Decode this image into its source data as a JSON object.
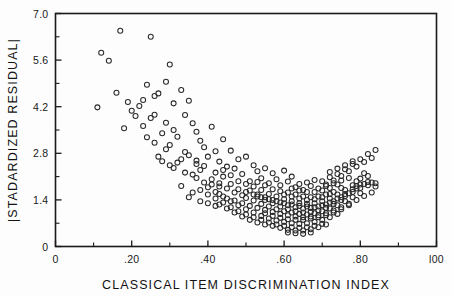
{
  "chart_data": {
    "type": "scatter",
    "title": "",
    "xlabel": "CLASSICAL ITEM DISCRIMINATION INDEX",
    "ylabel": "|STADARDIZED RESIDUAL|",
    "xlim": [
      0,
      1.0
    ],
    "ylim": [
      0,
      7.0
    ],
    "grid": false,
    "legend": null,
    "xticks": [
      0,
      0.2,
      0.4,
      0.6,
      0.8,
      1.0
    ],
    "xticklabels": [
      "0",
      ".20",
      ".40",
      ".60",
      ".80",
      "l00"
    ],
    "yticks": [
      0,
      1.4,
      2.8,
      4.2,
      5.6,
      7.0
    ],
    "yticklabels": [
      "0",
      "1.4",
      "2.8",
      "4.2",
      "5.6",
      "7.0"
    ],
    "x_minor_interval": 0.1,
    "y_minor_interval": 0.7,
    "marker": "open-circle",
    "marker_radius_px": 2.5,
    "marker_color": "#2a2a2a",
    "n_points": 301,
    "points": [
      [
        0.17,
        6.48
      ],
      [
        0.25,
        6.3
      ],
      [
        0.12,
        5.82
      ],
      [
        0.3,
        5.47
      ],
      [
        0.29,
        4.95
      ],
      [
        0.16,
        4.62
      ],
      [
        0.24,
        4.86
      ],
      [
        0.26,
        4.52
      ],
      [
        0.27,
        4.6
      ],
      [
        0.22,
        4.22
      ],
      [
        0.2,
        4.08
      ],
      [
        0.33,
        4.7
      ],
      [
        0.21,
        3.92
      ],
      [
        0.31,
        4.3
      ],
      [
        0.35,
        4.38
      ],
      [
        0.18,
        3.55
      ],
      [
        0.23,
        3.62
      ],
      [
        0.28,
        3.4
      ],
      [
        0.34,
        3.95
      ],
      [
        0.36,
        3.7
      ],
      [
        0.32,
        3.3
      ],
      [
        0.37,
        3.45
      ],
      [
        0.38,
        3.18
      ],
      [
        0.3,
        3.05
      ],
      [
        0.26,
        3.12
      ],
      [
        0.29,
        2.92
      ],
      [
        0.41,
        3.6
      ],
      [
        0.39,
        2.98
      ],
      [
        0.42,
        2.86
      ],
      [
        0.35,
        2.74
      ],
      [
        0.33,
        2.62
      ],
      [
        0.44,
        3.22
      ],
      [
        0.4,
        2.7
      ],
      [
        0.43,
        2.55
      ],
      [
        0.37,
        2.48
      ],
      [
        0.46,
        2.88
      ],
      [
        0.45,
        2.4
      ],
      [
        0.48,
        2.62
      ],
      [
        0.38,
        2.3
      ],
      [
        0.34,
        2.22
      ],
      [
        0.47,
        2.34
      ],
      [
        0.5,
        2.7
      ],
      [
        0.49,
        2.18
      ],
      [
        0.52,
        2.44
      ],
      [
        0.44,
        2.1
      ],
      [
        0.41,
        2.02
      ],
      [
        0.53,
        2.26
      ],
      [
        0.51,
        1.96
      ],
      [
        0.55,
        2.35
      ],
      [
        0.46,
        1.88
      ],
      [
        0.54,
        2.05
      ],
      [
        0.57,
        2.2
      ],
      [
        0.43,
        1.8
      ],
      [
        0.56,
        1.9
      ],
      [
        0.58,
        2.02
      ],
      [
        0.48,
        1.72
      ],
      [
        0.6,
        2.28
      ],
      [
        0.59,
        1.84
      ],
      [
        0.5,
        1.64
      ],
      [
        0.61,
        1.95
      ],
      [
        0.62,
        2.1
      ],
      [
        0.52,
        1.56
      ],
      [
        0.63,
        1.78
      ],
      [
        0.64,
        1.88
      ],
      [
        0.54,
        1.48
      ],
      [
        0.65,
        1.7
      ],
      [
        0.66,
        1.92
      ],
      [
        0.56,
        1.42
      ],
      [
        0.67,
        1.82
      ],
      [
        0.68,
        2.0
      ],
      [
        0.58,
        1.36
      ],
      [
        0.69,
        1.74
      ],
      [
        0.7,
        1.96
      ],
      [
        0.6,
        1.3
      ],
      [
        0.71,
        1.86
      ],
      [
        0.72,
        2.08
      ],
      [
        0.62,
        1.26
      ],
      [
        0.73,
        1.98
      ],
      [
        0.74,
        2.18
      ],
      [
        0.64,
        1.22
      ],
      [
        0.75,
        2.12
      ],
      [
        0.76,
        2.32
      ],
      [
        0.66,
        1.2
      ],
      [
        0.77,
        2.26
      ],
      [
        0.78,
        2.48
      ],
      [
        0.68,
        1.18
      ],
      [
        0.79,
        2.4
      ],
      [
        0.8,
        2.62
      ],
      [
        0.7,
        1.24
      ],
      [
        0.81,
        2.54
      ],
      [
        0.82,
        2.78
      ],
      [
        0.72,
        1.32
      ],
      [
        0.83,
        2.66
      ],
      [
        0.84,
        2.9
      ],
      [
        0.74,
        1.44
      ],
      [
        0.76,
        1.58
      ],
      [
        0.78,
        1.72
      ],
      [
        0.8,
        1.86
      ],
      [
        0.82,
        1.94
      ],
      [
        0.84,
        1.9
      ],
      [
        0.47,
        1.38
      ],
      [
        0.49,
        1.3
      ],
      [
        0.51,
        1.22
      ],
      [
        0.53,
        1.16
      ],
      [
        0.55,
        1.1
      ],
      [
        0.57,
        1.04
      ],
      [
        0.59,
        0.98
      ],
      [
        0.61,
        0.94
      ],
      [
        0.63,
        0.9
      ],
      [
        0.65,
        0.88
      ],
      [
        0.67,
        0.9
      ],
      [
        0.69,
        0.94
      ],
      [
        0.71,
        1.0
      ],
      [
        0.73,
        1.08
      ],
      [
        0.75,
        1.18
      ],
      [
        0.77,
        1.28
      ],
      [
        0.79,
        1.4
      ],
      [
        0.81,
        1.52
      ],
      [
        0.83,
        1.62
      ],
      [
        0.5,
        1.46
      ],
      [
        0.52,
        1.38
      ],
      [
        0.54,
        1.28
      ],
      [
        0.56,
        1.2
      ],
      [
        0.58,
        1.12
      ],
      [
        0.6,
        1.06
      ],
      [
        0.62,
        1.02
      ],
      [
        0.64,
        0.98
      ],
      [
        0.66,
        0.96
      ],
      [
        0.68,
        1.0
      ],
      [
        0.7,
        1.06
      ],
      [
        0.72,
        1.14
      ],
      [
        0.74,
        1.24
      ],
      [
        0.76,
        1.36
      ],
      [
        0.78,
        1.48
      ],
      [
        0.8,
        1.6
      ],
      [
        0.53,
        1.56
      ],
      [
        0.55,
        1.48
      ],
      [
        0.57,
        1.4
      ],
      [
        0.59,
        1.32
      ],
      [
        0.61,
        1.24
      ],
      [
        0.63,
        1.18
      ],
      [
        0.65,
        1.14
      ],
      [
        0.67,
        1.16
      ],
      [
        0.69,
        1.2
      ],
      [
        0.71,
        1.26
      ],
      [
        0.73,
        1.36
      ],
      [
        0.75,
        1.48
      ],
      [
        0.77,
        1.6
      ],
      [
        0.79,
        1.74
      ],
      [
        0.56,
        0.84
      ],
      [
        0.58,
        0.78
      ],
      [
        0.6,
        0.74
      ],
      [
        0.62,
        0.7
      ],
      [
        0.64,
        0.68
      ],
      [
        0.66,
        0.7
      ],
      [
        0.68,
        0.74
      ],
      [
        0.7,
        0.8
      ],
      [
        0.72,
        0.88
      ],
      [
        0.74,
        0.98
      ],
      [
        0.54,
        0.92
      ],
      [
        0.52,
        1.02
      ],
      [
        0.5,
        1.12
      ],
      [
        0.48,
        1.24
      ],
      [
        0.46,
        1.36
      ],
      [
        0.44,
        1.5
      ],
      [
        0.42,
        1.64
      ],
      [
        0.4,
        1.78
      ],
      [
        0.45,
        1.44
      ],
      [
        0.43,
        1.58
      ],
      [
        0.59,
        0.86
      ],
      [
        0.61,
        0.82
      ],
      [
        0.63,
        0.8
      ],
      [
        0.65,
        0.8
      ],
      [
        0.67,
        0.84
      ],
      [
        0.69,
        0.88
      ],
      [
        0.71,
        0.94
      ],
      [
        0.73,
        1.02
      ],
      [
        0.75,
        1.12
      ],
      [
        0.77,
        1.24
      ],
      [
        0.57,
        0.92
      ],
      [
        0.55,
        1.0
      ],
      [
        0.6,
        1.42
      ],
      [
        0.62,
        1.36
      ],
      [
        0.64,
        1.3
      ],
      [
        0.66,
        1.28
      ],
      [
        0.68,
        1.3
      ],
      [
        0.7,
        1.36
      ],
      [
        0.72,
        1.44
      ],
      [
        0.74,
        1.56
      ],
      [
        0.76,
        1.7
      ],
      [
        0.78,
        1.84
      ],
      [
        0.58,
        1.5
      ],
      [
        0.56,
        1.58
      ],
      [
        0.61,
        1.62
      ],
      [
        0.63,
        1.56
      ],
      [
        0.65,
        1.5
      ],
      [
        0.67,
        1.48
      ],
      [
        0.69,
        1.5
      ],
      [
        0.71,
        1.56
      ],
      [
        0.73,
        1.64
      ],
      [
        0.75,
        1.76
      ],
      [
        0.62,
        1.74
      ],
      [
        0.64,
        1.68
      ],
      [
        0.66,
        1.64
      ],
      [
        0.68,
        1.64
      ],
      [
        0.7,
        1.68
      ],
      [
        0.72,
        1.76
      ],
      [
        0.74,
        1.86
      ],
      [
        0.39,
        1.92
      ],
      [
        0.41,
        1.86
      ],
      [
        0.37,
        2.06
      ],
      [
        0.36,
        2.16
      ],
      [
        0.49,
        1.54
      ],
      [
        0.51,
        1.68
      ],
      [
        0.47,
        1.62
      ],
      [
        0.45,
        1.74
      ],
      [
        0.43,
        1.9
      ],
      [
        0.42,
        2.22
      ],
      [
        0.44,
        2.3
      ],
      [
        0.46,
        2.14
      ],
      [
        0.48,
        1.96
      ],
      [
        0.5,
        1.88
      ],
      [
        0.52,
        1.8
      ],
      [
        0.54,
        1.7
      ],
      [
        0.35,
        1.48
      ],
      [
        0.38,
        1.36
      ],
      [
        0.4,
        1.3
      ],
      [
        0.42,
        1.22
      ],
      [
        0.36,
        1.62
      ],
      [
        0.33,
        1.82
      ],
      [
        0.31,
        2.36
      ],
      [
        0.32,
        2.52
      ],
      [
        0.57,
        1.72
      ],
      [
        0.59,
        1.66
      ],
      [
        0.55,
        1.84
      ],
      [
        0.53,
        1.94
      ],
      [
        0.6,
        0.62
      ],
      [
        0.62,
        0.58
      ],
      [
        0.64,
        0.56
      ],
      [
        0.66,
        0.58
      ],
      [
        0.68,
        0.62
      ],
      [
        0.58,
        0.66
      ],
      [
        0.56,
        0.72
      ],
      [
        0.7,
        0.68
      ],
      [
        0.61,
        0.5
      ],
      [
        0.63,
        0.48
      ],
      [
        0.65,
        0.48
      ],
      [
        0.67,
        0.52
      ],
      [
        0.59,
        0.56
      ],
      [
        0.69,
        0.58
      ],
      [
        0.71,
        0.66
      ],
      [
        0.63,
        0.4
      ],
      [
        0.65,
        0.38
      ],
      [
        0.61,
        0.42
      ],
      [
        0.67,
        0.42
      ],
      [
        0.62,
        1.5
      ],
      [
        0.64,
        1.44
      ],
      [
        0.66,
        1.4
      ],
      [
        0.68,
        1.42
      ],
      [
        0.7,
        1.48
      ],
      [
        0.72,
        1.58
      ],
      [
        0.6,
        1.56
      ],
      [
        0.73,
        1.9
      ],
      [
        0.75,
        1.98
      ],
      [
        0.77,
        2.06
      ],
      [
        0.71,
        1.82
      ],
      [
        0.76,
        2.44
      ],
      [
        0.78,
        2.56
      ],
      [
        0.74,
        2.34
      ],
      [
        0.72,
        2.24
      ],
      [
        0.8,
        2.04
      ],
      [
        0.82,
        2.12
      ],
      [
        0.79,
        1.96
      ],
      [
        0.81,
        2.2
      ],
      [
        0.5,
        0.96
      ],
      [
        0.52,
        0.88
      ],
      [
        0.54,
        0.8
      ],
      [
        0.48,
        1.06
      ],
      [
        0.46,
        1.18
      ],
      [
        0.44,
        1.32
      ],
      [
        0.42,
        1.44
      ],
      [
        0.4,
        1.56
      ],
      [
        0.38,
        1.7
      ],
      [
        0.39,
        2.42
      ],
      [
        0.37,
        2.58
      ],
      [
        0.34,
        2.84
      ],
      [
        0.3,
        2.44
      ],
      [
        0.28,
        2.56
      ],
      [
        0.27,
        2.7
      ],
      [
        0.25,
        3.86
      ],
      [
        0.23,
        4.4
      ],
      [
        0.19,
        4.34
      ],
      [
        0.14,
        5.58
      ],
      [
        0.11,
        4.18
      ],
      [
        0.53,
        0.72
      ],
      [
        0.55,
        0.66
      ],
      [
        0.57,
        0.62
      ],
      [
        0.51,
        0.8
      ],
      [
        0.49,
        0.9
      ],
      [
        0.47,
        1.02
      ],
      [
        0.45,
        1.14
      ],
      [
        0.43,
        1.26
      ],
      [
        0.69,
        1.08
      ],
      [
        0.71,
        1.16
      ],
      [
        0.73,
        1.28
      ],
      [
        0.75,
        1.4
      ],
      [
        0.67,
        1.04
      ],
      [
        0.65,
        1.02
      ],
      [
        0.63,
        1.06
      ],
      [
        0.61,
        1.12
      ],
      [
        0.59,
        1.2
      ],
      [
        0.57,
        1.3
      ],
      [
        0.55,
        1.4
      ],
      [
        0.53,
        1.5
      ],
      [
        0.76,
        1.52
      ],
      [
        0.78,
        1.64
      ],
      [
        0.8,
        1.76
      ],
      [
        0.82,
        1.84
      ],
      [
        0.84,
        1.8
      ],
      [
        0.83,
        1.92
      ],
      [
        0.81,
        1.88
      ],
      [
        0.79,
        1.82
      ],
      [
        0.29,
        3.72
      ],
      [
        0.31,
        3.5
      ],
      [
        0.26,
        3.96
      ],
      [
        0.24,
        3.28
      ]
    ]
  },
  "figure": {
    "frame_color": "#1a1a1a",
    "background": "#fdfdfd"
  }
}
